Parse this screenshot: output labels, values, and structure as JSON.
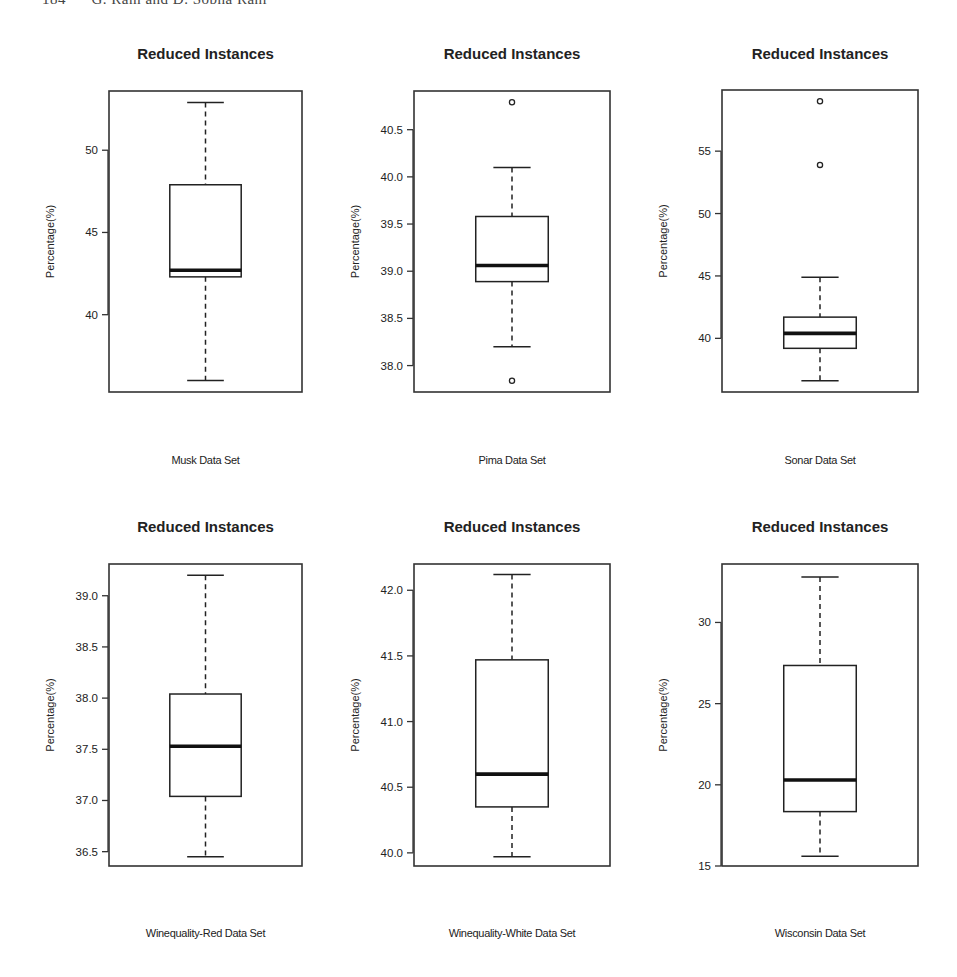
{
  "page": {
    "header": "184      G. Ram and D. Sobha Rani"
  },
  "chart_data": [
    {
      "type": "boxplot",
      "title": "Reduced Instances",
      "xlabel": "Musk Data Set",
      "ylabel": "Percentage(%)",
      "yticks": [
        40,
        45,
        50
      ],
      "ytick_labels": [
        "40",
        "45",
        "50"
      ],
      "ylim": [
        35.3,
        53.6
      ],
      "box": {
        "whisker_low": 36.0,
        "q1": 42.3,
        "median": 42.7,
        "q3": 47.9,
        "whisker_high": 52.9
      },
      "outliers": []
    },
    {
      "type": "boxplot",
      "title": "Reduced Instances",
      "xlabel": "Pima Data Set",
      "ylabel": "Percentage(%)",
      "yticks": [
        38.0,
        38.5,
        39.0,
        39.5,
        40.0,
        40.5
      ],
      "ytick_labels": [
        "38.0",
        "38.5",
        "39.0",
        "39.5",
        "40.0",
        "40.5"
      ],
      "ylim": [
        37.72,
        40.91
      ],
      "box": {
        "whisker_low": 38.2,
        "q1": 38.89,
        "median": 39.06,
        "q3": 39.58,
        "whisker_high": 40.1
      },
      "outliers": [
        40.79,
        37.84
      ]
    },
    {
      "type": "boxplot",
      "title": "Reduced Instances",
      "xlabel": "Sonar Data Set",
      "ylabel": "Percentage(%)",
      "yticks": [
        40,
        45,
        50,
        55
      ],
      "ytick_labels": [
        "40",
        "45",
        "50",
        "55"
      ],
      "ylim": [
        35.7,
        59.9
      ],
      "box": {
        "whisker_low": 36.6,
        "q1": 39.2,
        "median": 40.4,
        "q3": 41.7,
        "whisker_high": 44.9
      },
      "outliers": [
        59.0,
        53.9
      ]
    },
    {
      "type": "boxplot",
      "title": "Reduced Instances",
      "xlabel": "Winequality-Red Data Set",
      "ylabel": "Percentage(%)",
      "yticks": [
        36.5,
        37.0,
        37.5,
        38.0,
        38.5,
        39.0
      ],
      "ytick_labels": [
        "36.5",
        "37.0",
        "37.5",
        "38.0",
        "38.5",
        "39.0"
      ],
      "ylim": [
        36.36,
        39.31
      ],
      "box": {
        "whisker_low": 36.45,
        "q1": 37.04,
        "median": 37.53,
        "q3": 38.04,
        "whisker_high": 39.2
      },
      "outliers": []
    },
    {
      "type": "boxplot",
      "title": "Reduced Instances",
      "xlabel": "Winequality-White Data Set",
      "ylabel": "Percentage(%)",
      "yticks": [
        40.0,
        40.5,
        41.0,
        41.5,
        42.0
      ],
      "ytick_labels": [
        "40.0",
        "40.5",
        "41.0",
        "41.5",
        "42.0"
      ],
      "ylim": [
        39.9,
        42.2
      ],
      "box": {
        "whisker_low": 39.97,
        "q1": 40.35,
        "median": 40.6,
        "q3": 41.47,
        "whisker_high": 42.12
      },
      "outliers": []
    },
    {
      "type": "boxplot",
      "title": "Reduced Instances",
      "xlabel": "Wisconsin Data Set",
      "ylabel": "Percentage(%)",
      "yticks": [
        15,
        20,
        25,
        30
      ],
      "ytick_labels": [
        "15",
        "20",
        "25",
        "30"
      ],
      "ylim": [
        15.0,
        33.6
      ],
      "box": {
        "whisker_low": 15.6,
        "q1": 18.35,
        "median": 20.3,
        "q3": 27.35,
        "whisker_high": 32.8
      },
      "outliers": []
    }
  ]
}
